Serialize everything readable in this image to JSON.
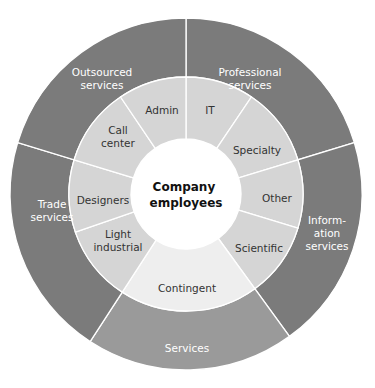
{
  "diagram": {
    "type": "sunburst",
    "center": {
      "label_lines": [
        "Company",
        "employees"
      ]
    },
    "geometry": {
      "cx": 186,
      "cy": 194,
      "r_outer": 176,
      "r_mid": 117,
      "r_inner": 55
    },
    "colors": {
      "outer_dark": "#7b7b7b",
      "outer_light": "#9a9a9a",
      "middle": "#d5d5d5",
      "middle_light": "#eeeeee",
      "center": "#ffffff",
      "divider": "#ffffff"
    },
    "outer_segments": [
      {
        "name": "Professional services",
        "label_lines": [
          "Professional",
          "services"
        ],
        "start": 0,
        "end": 73,
        "color": "#7b7b7b",
        "lx": 250,
        "ly": 78
      },
      {
        "name": "Information services",
        "label_lines": [
          "Inform-",
          "ation",
          "services"
        ],
        "start": 73,
        "end": 144,
        "color": "#7b7b7b",
        "lx": 327,
        "ly": 233
      },
      {
        "name": "Services",
        "label_lines": [
          "Services"
        ],
        "start": 144,
        "end": 213,
        "color": "#9a9a9a",
        "lx": 187,
        "ly": 348
      },
      {
        "name": "Trade services",
        "label_lines": [
          "Trade",
          "services"
        ],
        "start": 213,
        "end": 287,
        "color": "#7b7b7b",
        "lx": 52,
        "ly": 210
      },
      {
        "name": "Outsourced services",
        "label_lines": [
          "Outsourced",
          "services"
        ],
        "start": 287,
        "end": 360,
        "color": "#7b7b7b",
        "lx": 102,
        "ly": 78
      }
    ],
    "middle_segments": [
      {
        "name": "IT",
        "label_lines": [
          "IT"
        ],
        "start": 0,
        "end": 34,
        "color": "#d5d5d5",
        "lx": 210,
        "ly": 110
      },
      {
        "name": "Specialty",
        "label_lines": [
          "Specialty"
        ],
        "start": 34,
        "end": 73,
        "color": "#d5d5d5",
        "lx": 257,
        "ly": 150
      },
      {
        "name": "Other",
        "label_lines": [
          "Other"
        ],
        "start": 73,
        "end": 107,
        "color": "#d5d5d5",
        "lx": 277,
        "ly": 198
      },
      {
        "name": "Scientific",
        "label_lines": [
          "Scientific"
        ],
        "start": 107,
        "end": 144,
        "color": "#d5d5d5",
        "lx": 259,
        "ly": 248
      },
      {
        "name": "Contingent",
        "label_lines": [
          "Contingent"
        ],
        "start": 144,
        "end": 213,
        "color": "#eeeeee",
        "lx": 187,
        "ly": 288
      },
      {
        "name": "Light industrial",
        "label_lines": [
          "Light",
          "industrial"
        ],
        "start": 213,
        "end": 251,
        "color": "#d5d5d5",
        "lx": 118,
        "ly": 240
      },
      {
        "name": "Designers",
        "label_lines": [
          "Designers"
        ],
        "start": 251,
        "end": 287,
        "color": "#d5d5d5",
        "lx": 103,
        "ly": 200
      },
      {
        "name": "Call center",
        "label_lines": [
          "Call",
          "center"
        ],
        "start": 287,
        "end": 326,
        "color": "#d5d5d5",
        "lx": 118,
        "ly": 136
      },
      {
        "name": "Admin",
        "label_lines": [
          "Admin"
        ],
        "start": 326,
        "end": 360,
        "color": "#d5d5d5",
        "lx": 162,
        "ly": 110
      }
    ]
  }
}
